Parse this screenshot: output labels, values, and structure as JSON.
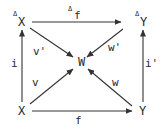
{
  "diagram": {
    "type": "commutative-diagram",
    "nodes": {
      "top_left": {
        "base": "X",
        "sup": "Δ"
      },
      "top_right": {
        "base": "Y",
        "sup": "Δ"
      },
      "bottom_left": {
        "base": "X"
      },
      "bottom_right": {
        "base": "Y"
      },
      "center": {
        "base": "W"
      }
    },
    "edges": {
      "top": {
        "label": "f",
        "sup": "Δ",
        "from": "ΔX",
        "to": "ΔY"
      },
      "bottom": {
        "label": "f",
        "from": "X",
        "to": "Y"
      },
      "left": {
        "label": "i",
        "from": "X",
        "to": "ΔX"
      },
      "right": {
        "label": "i'",
        "from": "Y",
        "to": "ΔY"
      },
      "diag_top_left": {
        "label": "v'",
        "from": "ΔX",
        "to": "W"
      },
      "diag_top_right": {
        "label": "w'",
        "from": "ΔY",
        "to": "W"
      },
      "diag_bottom_left": {
        "label": "v",
        "from": "X",
        "to": "W"
      },
      "diag_bottom_right": {
        "label": "w",
        "from": "Y",
        "to": "W"
      }
    },
    "colors": {
      "ink": "#2a2a2a",
      "background": "#ffffff"
    }
  }
}
